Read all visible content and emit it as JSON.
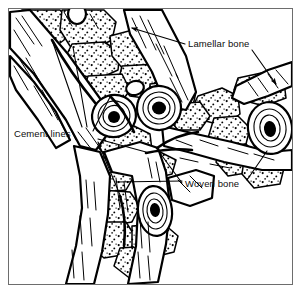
{
  "figure": {
    "frame": {
      "stroke_color": "#6d6d6d",
      "background": "#ffffff"
    },
    "ink_color": "#000000",
    "labels": [
      {
        "id": "lamellar-bone",
        "text": "Lamellar bone",
        "x": 188,
        "y": 38
      },
      {
        "id": "cement-lines",
        "text": "Cement lines",
        "x": 14,
        "y": 128
      },
      {
        "id": "woven-bone",
        "text": "Woven bone",
        "x": 185,
        "y": 178
      }
    ],
    "leader_lines": [
      {
        "label": "lamellar-bone",
        "from": [
          186,
          44
        ],
        "to": [
          128,
          28
        ],
        "arrow": true
      },
      {
        "label": "lamellar-bone",
        "from": [
          252,
          50
        ],
        "to": [
          279,
          86
        ],
        "arrow": true
      },
      {
        "label": "cement-lines",
        "from": [
          82,
          128
        ],
        "to": [
          52,
          40
        ],
        "arrow": false
      },
      {
        "label": "cement-lines",
        "from": [
          86,
          128
        ],
        "to": [
          72,
          46
        ],
        "arrow": false
      },
      {
        "label": "cement-lines",
        "from": [
          92,
          131
        ],
        "to": [
          110,
          96
        ],
        "arrow": false
      },
      {
        "label": "cement-lines",
        "from": [
          97,
          140
        ],
        "to": [
          146,
          153
        ],
        "arrow": false
      },
      {
        "label": "cement-lines",
        "from": [
          97,
          143
        ],
        "to": [
          120,
          196
        ],
        "arrow": false
      },
      {
        "label": "woven-bone",
        "from": [
          183,
          184
        ],
        "to": [
          157,
          148
        ],
        "arrow": false
      },
      {
        "label": "woven-bone",
        "from": [
          183,
          182
        ],
        "to": [
          118,
          183
        ],
        "arrow": false
      },
      {
        "label": "woven-bone",
        "from": [
          247,
          180
        ],
        "to": [
          268,
          150
        ],
        "arrow": false
      }
    ],
    "features": {
      "osteons": [
        {
          "id": "osteon-upper-left",
          "cx": 114,
          "cy": 116,
          "rx": 22,
          "ry": 21,
          "canal_rx": 6,
          "canal_ry": 6
        },
        {
          "id": "osteon-upper-right",
          "cx": 159,
          "cy": 108,
          "rx": 22,
          "ry": 22,
          "canal_rx": 7,
          "canal_ry": 7
        },
        {
          "id": "osteon-right-edge",
          "cx": 270,
          "cy": 128,
          "rx": 22,
          "ry": 26,
          "canal_rx": 6,
          "canal_ry": 8
        },
        {
          "id": "osteon-lower",
          "cx": 155,
          "cy": 211,
          "rx": 17,
          "ry": 25,
          "canal_rx": 5,
          "canal_ry": 7
        }
      ],
      "tissue_types": [
        "lamellar bone",
        "woven bone",
        "cement lines"
      ]
    }
  }
}
